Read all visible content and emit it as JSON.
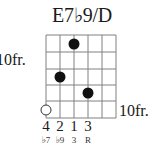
{
  "chord": {
    "name": "E7♭9/D",
    "fret_label_left": "10fr.",
    "fret_label_right": "10fr.",
    "strings": 6,
    "frets_shown": 5,
    "positions": [
      {
        "string": 1,
        "fret": 5,
        "type": "open-circle"
      },
      {
        "string": 2,
        "fret": 3,
        "type": "dot"
      },
      {
        "string": 3,
        "fret": 1,
        "type": "dot"
      },
      {
        "string": 4,
        "fret": 4,
        "type": "dot"
      }
    ],
    "fingers": [
      "4",
      "2",
      "1",
      "3"
    ],
    "intervals": [
      "♭7",
      "♭9",
      "3",
      "R"
    ],
    "colors": {
      "line": "#808080",
      "dot": "#111111"
    }
  }
}
